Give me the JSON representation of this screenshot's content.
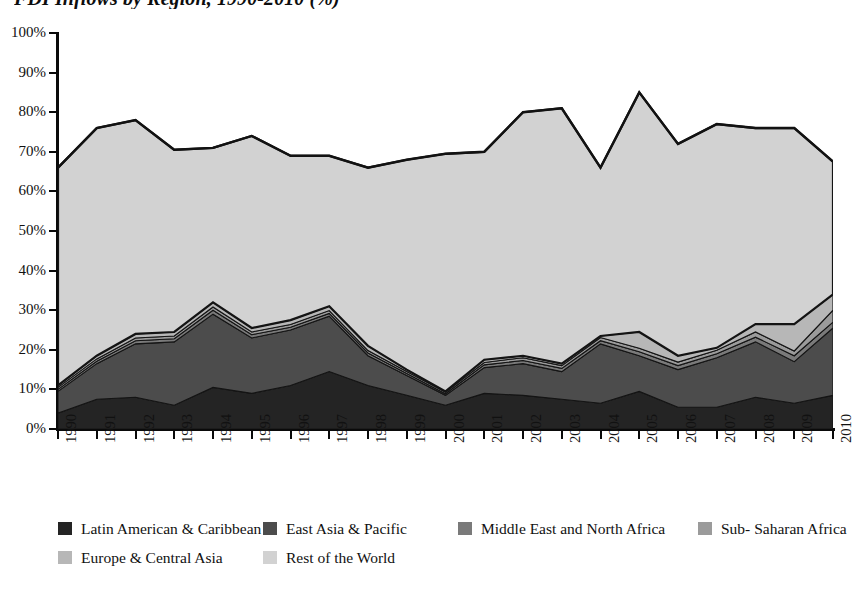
{
  "title": "FDI Inflows by Region, 1990-2010 (%)",
  "chart_data": {
    "type": "area",
    "stacked": true,
    "title": "FDI Inflows by Region, 1990-2010 (%)",
    "xlabel": "",
    "ylabel": "",
    "ylim": [
      0,
      100
    ],
    "ytick_labels": [
      "0%",
      "10%",
      "20%",
      "30%",
      "40%",
      "50%",
      "60%",
      "70%",
      "80%",
      "90%",
      "100%"
    ],
    "ytick_values": [
      0,
      10,
      20,
      30,
      40,
      50,
      60,
      70,
      80,
      90,
      100
    ],
    "grid": false,
    "legend_position": "bottom",
    "categories": [
      "1990",
      "1991",
      "1992",
      "1993",
      "1994",
      "1995",
      "1996",
      "1997",
      "1998",
      "1999",
      "2000",
      "2001",
      "2002",
      "2003",
      "2004",
      "2005",
      "2006",
      "2007",
      "2008",
      "2009",
      "2010"
    ],
    "series": [
      {
        "name": "Latin American & Caribbean",
        "color": "#242424",
        "values": [
          4.0,
          7.5,
          8.0,
          6.0,
          10.5,
          9.0,
          11.0,
          14.5,
          11.0,
          8.5,
          6.0,
          9.0,
          8.5,
          7.5,
          6.5,
          9.5,
          5.5,
          5.5,
          8.0,
          6.5,
          8.5
        ]
      },
      {
        "name": "East Asia & Pacific",
        "color": "#4c4c4c",
        "values": [
          5.5,
          9.0,
          13.5,
          16.0,
          18.5,
          14.0,
          14.0,
          14.0,
          7.5,
          5.0,
          2.5,
          6.5,
          8.0,
          7.0,
          15.0,
          9.0,
          9.5,
          12.5,
          14.0,
          10.5,
          17.0
        ]
      },
      {
        "name": "Middle East and North Africa",
        "color": "#7a7a7a",
        "values": [
          0.5,
          0.6,
          0.8,
          0.8,
          1.0,
          0.8,
          0.7,
          0.7,
          0.7,
          0.5,
          0.4,
          0.7,
          0.8,
          0.8,
          0.8,
          1.0,
          1.0,
          1.0,
          1.2,
          1.5,
          1.5
        ]
      },
      {
        "name": "Sub- Saharan Africa",
        "color": "#9b9b9b",
        "values": [
          0.5,
          0.6,
          0.7,
          0.7,
          0.8,
          0.7,
          0.7,
          0.7,
          0.6,
          0.5,
          0.4,
          0.6,
          0.7,
          0.7,
          0.8,
          0.9,
          0.9,
          0.9,
          1.3,
          1.2,
          3.0
        ]
      },
      {
        "name": "Europe & Central Asia",
        "color": "#b7b7b7",
        "values": [
          0.5,
          0.8,
          1.0,
          1.0,
          1.2,
          1.0,
          1.1,
          1.1,
          1.2,
          0.5,
          0.2,
          0.7,
          0.5,
          0.5,
          0.4,
          4.1,
          1.6,
          0.6,
          2.0,
          6.8,
          4.0
        ]
      },
      {
        "name": "Rest of the World",
        "color": "#d2d2d2",
        "values": [
          55.0,
          57.5,
          54.0,
          46.0,
          39.0,
          48.5,
          41.5,
          38.0,
          45.0,
          53.0,
          60.0,
          52.5,
          61.5,
          64.5,
          42.5,
          60.5,
          53.5,
          56.5,
          49.5,
          49.5,
          33.5
        ]
      }
    ],
    "top_line_values": [
      66.0,
      76.0,
      78.0,
      70.5,
      71.0,
      74.0,
      69.0,
      69.0,
      66.0,
      68.0,
      69.5,
      70.0,
      80.0,
      81.0,
      66.0,
      85.0,
      72.0,
      77.0,
      76.0,
      76.0,
      67.5
    ]
  },
  "legend": {
    "rows": [
      [
        {
          "label": "Latin American & Caribbean",
          "color": "#242424"
        },
        {
          "label": "East Asia & Pacific",
          "color": "#4c4c4c"
        },
        {
          "label": "Middle East and North Africa",
          "color": "#7a7a7a"
        },
        {
          "label": "Sub- Saharan Africa",
          "color": "#9b9b9b"
        }
      ],
      [
        {
          "label": "Europe & Central Asia",
          "color": "#b7b7b7"
        },
        {
          "label": "Rest of the World",
          "color": "#d2d2d2"
        }
      ]
    ]
  },
  "colors": {
    "axis": "#0a0a0a",
    "outline": "#111111",
    "background": "#ffffff"
  }
}
